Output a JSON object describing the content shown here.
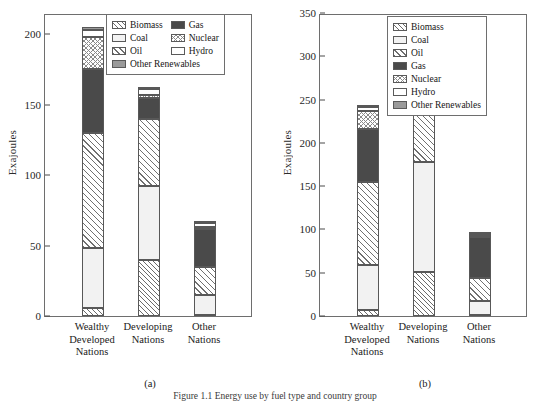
{
  "figure": {
    "caption_partial": "Figure 1.1  Energy use by fuel type and country group",
    "ylabel": "Exajoules"
  },
  "series_order": [
    "Biomass",
    "Coal",
    "Oil",
    "Gas",
    "Nuclear",
    "Hydro",
    "Other Renewables"
  ],
  "series_styles": {
    "Biomass": "hatch-diagonal-fine",
    "Coal": "solid-light-gray",
    "Oil": "hatch-diagonal-wide",
    "Gas": "solid-dark-gray",
    "Nuclear": "crosshatch-light",
    "Hydro": "solid-white",
    "Other Renewables": "solid-mid-gray"
  },
  "colors": {
    "biomass": "#ffffff",
    "coal": "#f2f2f2",
    "oil": "#ffffff",
    "gas": "#4a4a4a",
    "nuclear": "#ffffff",
    "hydro": "#ffffff",
    "other_renewables": "#9a9a9a",
    "axis": "#6e6e6e",
    "text": "#1a1a1a"
  },
  "panel_a": {
    "label": "(a)",
    "legend_layout": "two-column",
    "legend_items": [
      "Biomass",
      "Gas",
      "Coal",
      "Nuclear",
      "Oil",
      "Hydro",
      "Other Renewables"
    ]
  },
  "panel_b": {
    "label": "(b)",
    "legend_layout": "one-column",
    "legend_items": [
      "Biomass",
      "Coal",
      "Oil",
      "Gas",
      "Nuclear",
      "Hydro",
      "Other Renewables"
    ]
  },
  "chart_data": [
    {
      "type": "bar",
      "subtype": "stacked",
      "panel": "(a)",
      "title": "",
      "xlabel": "",
      "ylabel": "Exajoules",
      "ylim": [
        0,
        215
      ],
      "yticks": [
        0,
        50,
        100,
        150,
        200
      ],
      "ytick_labels": [
        "0",
        "50",
        "100",
        "150",
        "200"
      ],
      "grid": false,
      "legend_position": "top-center",
      "categories": [
        "Wealthy Developed Nations",
        "Developing Nations",
        "Other Nations"
      ],
      "category_lines": [
        [
          "Wealthy",
          "Developed",
          "Nations"
        ],
        [
          "Developing",
          "Nations"
        ],
        [
          "Other",
          "Nations"
        ]
      ],
      "series": [
        {
          "name": "Biomass",
          "values": [
            6,
            40,
            1
          ]
        },
        {
          "name": "Coal",
          "values": [
            42,
            52,
            14
          ]
        },
        {
          "name": "Oil",
          "values": [
            82,
            48,
            20
          ]
        },
        {
          "name": "Gas",
          "values": [
            45,
            15,
            27
          ]
        },
        {
          "name": "Nuclear",
          "values": [
            23,
            2,
            1
          ]
        },
        {
          "name": "Hydro",
          "values": [
            5,
            4,
            3
          ]
        },
        {
          "name": "Other Renewables",
          "values": [
            2,
            1,
            1
          ]
        }
      ],
      "totals": [
        205,
        162,
        67
      ]
    },
    {
      "type": "bar",
      "subtype": "stacked",
      "panel": "(b)",
      "title": "",
      "xlabel": "",
      "ylabel": "Exajoules",
      "ylim": [
        0,
        350
      ],
      "yticks": [
        0,
        50,
        100,
        150,
        200,
        250,
        300,
        350
      ],
      "ytick_labels": [
        "0",
        "50",
        "100",
        "150",
        "200",
        "250",
        "300",
        "350"
      ],
      "grid": false,
      "legend_position": "top-right",
      "categories": [
        "Wealthy Developed Nations",
        "Developing Nations",
        "Other Nations"
      ],
      "category_lines": [
        [
          "Wealthy",
          "Developed",
          "Nations"
        ],
        [
          "Developing",
          "Nations"
        ],
        [
          "Other",
          "Nations"
        ]
      ],
      "series": [
        {
          "name": "Biomass",
          "values": [
            7,
            51,
            1
          ]
        },
        {
          "name": "Coal",
          "values": [
            52,
            127,
            16
          ]
        },
        {
          "name": "Oil",
          "values": [
            96,
            91,
            27
          ]
        },
        {
          "name": "Gas",
          "values": [
            61,
            41,
            47
          ]
        },
        {
          "name": "Nuclear",
          "values": [
            21,
            5,
            1
          ]
        },
        {
          "name": "Hydro",
          "values": [
            5,
            8,
            3
          ]
        },
        {
          "name": "Other Renewables",
          "values": [
            1,
            2,
            1
          ]
        }
      ],
      "totals": [
        243,
        325,
        96
      ]
    }
  ]
}
